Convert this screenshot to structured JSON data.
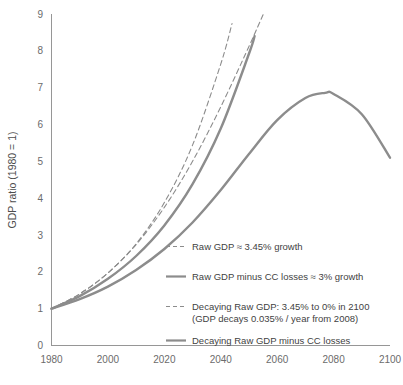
{
  "chart_data": {
    "type": "line",
    "title": "",
    "xlabel": "",
    "ylabel": "GDP ratio (1980 = 1)",
    "xlim": [
      1980,
      2100
    ],
    "ylim": [
      0,
      9
    ],
    "xticks": [
      "1980",
      "2000",
      "2020",
      "2040",
      "2060",
      "2080",
      "2100"
    ],
    "yticks": [
      "0",
      "1",
      "2",
      "3",
      "4",
      "5",
      "6",
      "7",
      "8",
      "9"
    ],
    "grid": false,
    "legend_position": "inside-lower-right",
    "line_color": "#8c8c8c",
    "series": [
      {
        "name": "Raw GDP ≈ 3.45% growth",
        "style": "dashed",
        "x": [
          1980,
          1990,
          2000,
          2010,
          2020,
          2030,
          2040,
          2044
        ],
        "values": [
          1.0,
          1.4,
          1.97,
          2.76,
          3.88,
          5.44,
          7.64,
          8.74
        ]
      },
      {
        "name": "Raw GDP minus CC losses ≈ 3% growth",
        "style": "solid",
        "x": [
          1980,
          1990,
          2000,
          2010,
          2020,
          2030,
          2040,
          2050,
          2052
        ],
        "values": [
          1.0,
          1.34,
          1.81,
          2.43,
          3.26,
          4.38,
          5.89,
          7.92,
          8.4
        ]
      },
      {
        "name": "Decaying Raw GDP: 3.45% to 0% in 2100 (GDP decays 0.035% / year from 2008)",
        "style": "dashed",
        "x": [
          1980,
          1990,
          2000,
          2010,
          2020,
          2030,
          2040,
          2050,
          2055
        ],
        "values": [
          1.0,
          1.4,
          1.97,
          2.74,
          3.75,
          5.0,
          6.48,
          8.12,
          8.98
        ]
      },
      {
        "name": "Decaying Raw GDP minus CC losses",
        "style": "solid",
        "x": [
          1980,
          1990,
          2000,
          2010,
          2020,
          2030,
          2040,
          2050,
          2060,
          2070,
          2077,
          2080,
          2090,
          2100
        ],
        "values": [
          1.0,
          1.26,
          1.6,
          2.05,
          2.62,
          3.34,
          4.22,
          5.2,
          6.12,
          6.72,
          6.86,
          6.83,
          6.28,
          5.1
        ]
      }
    ],
    "legend_entries": [
      {
        "style": "dashed",
        "lines": [
          "Raw GDP ≈ 3.45% growth"
        ]
      },
      {
        "style": "solid",
        "lines": [
          "Raw GDP minus CC losses ≈ 3% growth"
        ]
      },
      {
        "style": "dashed",
        "lines": [
          "Decaying Raw GDP: 3.45% to 0% in 2100",
          "(GDP decays 0.035% / year from 2008)"
        ]
      },
      {
        "style": "solid",
        "lines": [
          "Decaying Raw GDP minus CC losses"
        ]
      }
    ]
  }
}
